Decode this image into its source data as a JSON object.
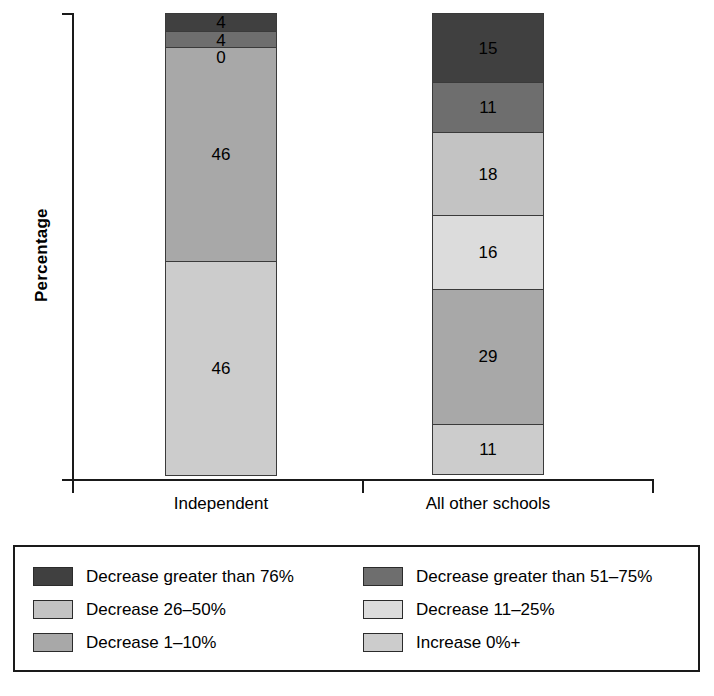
{
  "chart_data": {
    "type": "bar",
    "title": "",
    "subtitle": "",
    "xlabel": "",
    "ylabel": "Percentage",
    "stacked": true,
    "grid": false,
    "legend_position": "bottom",
    "ylim": [
      0,
      100
    ],
    "categories": [
      "Independent",
      "All other schools"
    ],
    "series": [
      {
        "name": "Decrease greater than 76%",
        "color": "#404040",
        "values": [
          4,
          15
        ]
      },
      {
        "name": "Decrease greater than 51–75%",
        "color": "#6e6e6e",
        "values": [
          4,
          11
        ]
      },
      {
        "name": "Decrease 26–50%",
        "color": "#c3c3c3",
        "values": [
          0,
          18
        ]
      },
      {
        "name": "Decrease 11–25%",
        "color": "#dcdcdc",
        "values": [
          0,
          16
        ]
      },
      {
        "name": "Decrease 1–10%",
        "color": "#a8a8a8",
        "values": [
          46,
          29
        ]
      },
      {
        "name": "Increase 0%+",
        "color": "#cccccc",
        "values": [
          46,
          11
        ]
      }
    ],
    "bars": [
      {
        "category": "Independent",
        "segments": [
          {
            "label": "4",
            "value": 4,
            "color": "#404040",
            "series": "Decrease greater than 76%"
          },
          {
            "label": "4",
            "value": 4,
            "color": "#6e6e6e",
            "series": "Decrease greater than 51–75%"
          },
          {
            "label": "0",
            "value": 0,
            "color": "#c3c3c3",
            "series": "Decrease 26–50%"
          },
          {
            "label": "46",
            "value": 46,
            "color": "#a8a8a8",
            "series": "Decrease 1–10%"
          },
          {
            "label": "46",
            "value": 46,
            "color": "#cccccc",
            "series": "Increase 0%+"
          }
        ]
      },
      {
        "category": "All other schools",
        "segments": [
          {
            "label": "15",
            "value": 15,
            "color": "#404040",
            "series": "Decrease greater than 76%"
          },
          {
            "label": "11",
            "value": 11,
            "color": "#6e6e6e",
            "series": "Decrease greater than 51–75%"
          },
          {
            "label": "18",
            "value": 18,
            "color": "#c3c3c3",
            "series": "Decrease 26–50%"
          },
          {
            "label": "16",
            "value": 16,
            "color": "#dcdcdc",
            "series": "Decrease 11–25%"
          },
          {
            "label": "29",
            "value": 29,
            "color": "#a8a8a8",
            "series": "Decrease 1–10%"
          },
          {
            "label": "11",
            "value": 11,
            "color": "#cccccc",
            "series": "Increase 0%+"
          }
        ]
      }
    ]
  },
  "axes": {
    "y_title": "Percentage",
    "category_labels": [
      "Independent",
      "All other schools"
    ]
  },
  "legend": {
    "items": [
      {
        "label": "Decrease greater than 76%",
        "color": "#404040"
      },
      {
        "label": "Decrease greater than 51–75%",
        "color": "#6e6e6e"
      },
      {
        "label": "Decrease 26–50%",
        "color": "#c3c3c3"
      },
      {
        "label": "Decrease 11–25%",
        "color": "#dcdcdc"
      },
      {
        "label": "Decrease 1–10%",
        "color": "#a8a8a8"
      },
      {
        "label": "Increase 0%+",
        "color": "#cccccc"
      }
    ]
  },
  "colors": {
    "axis": "#1a1a1a",
    "segment_border": "#3a3a3a",
    "legend_border": "#1a1a1a",
    "background": "#ffffff"
  }
}
